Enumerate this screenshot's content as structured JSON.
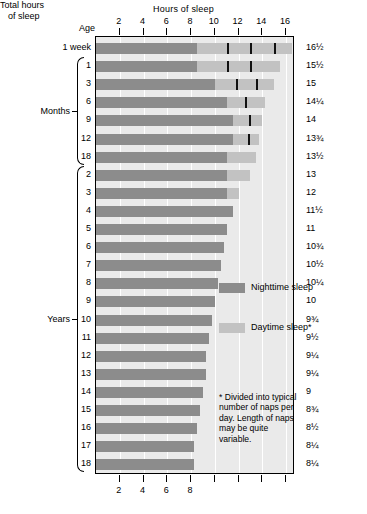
{
  "chart_data": {
    "type": "bar",
    "title": "Hours of sleep",
    "xlabel": "Hours of sleep",
    "ylabel": "Age",
    "right_axis_label_line1": "Total hours",
    "right_axis_label_line2": "of sleep",
    "xlim": [
      0,
      16.75
    ],
    "xticks": [
      2,
      4,
      6,
      8,
      10,
      12,
      14,
      16
    ],
    "xticklabels": [
      "2",
      "4",
      "6",
      "8",
      "10",
      "12",
      "14",
      "16"
    ],
    "grid": true,
    "gridlines_at": [
      2,
      4,
      6,
      8,
      10,
      12,
      14,
      16
    ],
    "legend_position": "inside-right",
    "stacked": true,
    "series": [
      {
        "name": "Nighttime sleep",
        "color": "#8c8c8c"
      },
      {
        "name": "Daytime sleep*",
        "color": "#c2c2c2"
      }
    ],
    "categories": [
      "1 week",
      "1",
      "3",
      "6",
      "9",
      "12",
      "18",
      "2",
      "3",
      "4",
      "5",
      "6",
      "7",
      "8",
      "9",
      "10",
      "11",
      "12",
      "13",
      "14",
      "15",
      "16",
      "17",
      "18"
    ],
    "rows": [
      {
        "age": "1 week",
        "night": 8.5,
        "day": 8.0,
        "total": "16½",
        "naps": [
          11.0,
          13.0,
          15.0
        ]
      },
      {
        "age": "1",
        "night": 8.5,
        "day": 7.0,
        "total": "15½",
        "naps": [
          11.0,
          13.0
        ]
      },
      {
        "age": "3",
        "night": 10.0,
        "day": 5.0,
        "total": "15",
        "naps": [
          11.75,
          13.5
        ]
      },
      {
        "age": "6",
        "night": 11.0,
        "day": 3.25,
        "total": "14¼",
        "naps": [
          12.5
        ]
      },
      {
        "age": "9",
        "night": 11.5,
        "day": 2.5,
        "total": "14",
        "naps": [
          12.9
        ]
      },
      {
        "age": "12",
        "night": 11.5,
        "day": 2.25,
        "total": "13¾",
        "naps": [
          12.8
        ]
      },
      {
        "age": "18",
        "night": 11.0,
        "day": 2.5,
        "total": "13½",
        "naps": []
      },
      {
        "age": "2",
        "night": 11.0,
        "day": 2.0,
        "total": "13",
        "naps": []
      },
      {
        "age": "3",
        "night": 11.0,
        "day": 1.0,
        "total": "12",
        "naps": []
      },
      {
        "age": "4",
        "night": 11.5,
        "day": 0.0,
        "total": "11½",
        "naps": []
      },
      {
        "age": "5",
        "night": 11.0,
        "day": 0.0,
        "total": "11",
        "naps": []
      },
      {
        "age": "6",
        "night": 10.75,
        "day": 0.0,
        "total": "10¾",
        "naps": []
      },
      {
        "age": "7",
        "night": 10.5,
        "day": 0.0,
        "total": "10½",
        "naps": []
      },
      {
        "age": "8",
        "night": 10.25,
        "day": 0.0,
        "total": "10¼",
        "naps": []
      },
      {
        "age": "9",
        "night": 10.0,
        "day": 0.0,
        "total": "10",
        "naps": []
      },
      {
        "age": "10",
        "night": 9.75,
        "day": 0.0,
        "total": "9¾",
        "naps": []
      },
      {
        "age": "11",
        "night": 9.5,
        "day": 0.0,
        "total": "9½",
        "naps": []
      },
      {
        "age": "12",
        "night": 9.25,
        "day": 0.0,
        "total": "9¼",
        "naps": []
      },
      {
        "age": "13",
        "night": 9.25,
        "day": 0.0,
        "total": "9¼",
        "naps": []
      },
      {
        "age": "14",
        "night": 9.0,
        "day": 0.0,
        "total": "9",
        "naps": []
      },
      {
        "age": "15",
        "night": 8.75,
        "day": 0.0,
        "total": "8¾",
        "naps": []
      },
      {
        "age": "16",
        "night": 8.5,
        "day": 0.0,
        "total": "8½",
        "naps": []
      },
      {
        "age": "17",
        "night": 8.25,
        "day": 0.0,
        "total": "8¼",
        "naps": []
      },
      {
        "age": "18",
        "night": 8.25,
        "day": 0.0,
        "total": "8¼",
        "naps": []
      }
    ],
    "group_labels": [
      {
        "label": "Months",
        "first_row": 1,
        "last_row": 6
      },
      {
        "label": "Years",
        "first_row": 7,
        "last_row": 23
      }
    ],
    "annotations": {
      "footnote": "* Divided into typical number of naps per day. Length of naps may be quite variable."
    }
  },
  "colors": {
    "night": "#8c8c8c",
    "day": "#c2c2c2",
    "plot_background": "#eaeaea",
    "gridline": "#ffffff",
    "nap_marker": "#111111",
    "axis": "#000000"
  }
}
